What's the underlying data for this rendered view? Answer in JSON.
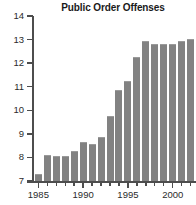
{
  "chart_data": {
    "type": "bar",
    "title": "Public Order Offenses",
    "xlabel": "",
    "ylabel": "",
    "categories": [
      1985,
      1986,
      1987,
      1988,
      1989,
      1990,
      1991,
      1992,
      1993,
      1994,
      1995,
      1996,
      1997,
      1998,
      1999,
      2000,
      2001,
      2002
    ],
    "values": [
      7.3,
      8.1,
      8.08,
      8.08,
      8.27,
      8.66,
      8.57,
      8.86,
      9.76,
      10.85,
      11.24,
      12.25,
      12.94,
      12.83,
      12.83,
      12.83,
      12.93,
      13.02
    ],
    "ylim": [
      7,
      14
    ],
    "xlim": [
      1984.4,
      2002.6
    ],
    "ytick_labels": [
      "7",
      "8",
      "9",
      "10",
      "11",
      "12",
      "13",
      "14"
    ],
    "ytick_values": [
      7,
      8,
      9,
      10,
      11,
      12,
      13,
      14
    ],
    "xtick_major_labels": [
      "1985",
      "1990",
      "1995",
      "2000"
    ],
    "xtick_major_values": [
      1985,
      1990,
      1995,
      2000
    ],
    "xtick_minor_values": [
      1986,
      1987,
      1988,
      1989,
      1991,
      1992,
      1993,
      1994,
      1996,
      1997,
      1998,
      1999,
      2001,
      2002
    ],
    "grid": false,
    "legend": "none",
    "bar_color": "#828282",
    "axis_color": "#4d4d4d",
    "text_color": "#2b2b2b",
    "background": "#ffffff"
  }
}
